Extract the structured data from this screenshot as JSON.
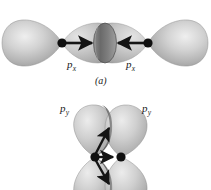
{
  "figure": {
    "background_color": "#ffffff",
    "ink_color": "#141414",
    "orbital_light": "#e2e2e2",
    "orbital_mid": "#b8b8b8",
    "orbital_dark": "#6e6e6e",
    "orbital_shadow": "#4a4a4a",
    "panels": [
      {
        "id": "panel-a",
        "caption": "(a)",
        "description": "Head-on (sigma) overlap of two p-x orbitals",
        "labels": [
          {
            "id": "label-px-left",
            "symbol": "p",
            "subscript": "x"
          },
          {
            "id": "label-px-right",
            "symbol": "p",
            "subscript": "x"
          }
        ],
        "nuclei": [
          {
            "id": "nucleus-left",
            "cx": 62,
            "cy": 43
          },
          {
            "id": "nucleus-right",
            "cx": 148,
            "cy": 43
          }
        ],
        "arrows": [
          {
            "id": "arrow-right",
            "x1": 64,
            "y1": 43,
            "x2": 94,
            "y2": 43,
            "direction": "right"
          },
          {
            "id": "arrow-left",
            "x1": 146,
            "y1": 43,
            "x2": 116,
            "y2": 43,
            "direction": "left"
          }
        ]
      },
      {
        "id": "panel-b",
        "caption": "",
        "description": "Side-by-side (pi) overlap of two p-y orbitals",
        "labels": [
          {
            "id": "label-py-left",
            "symbol": "p",
            "subscript": "y"
          },
          {
            "id": "label-py-right",
            "symbol": "p",
            "subscript": "y"
          }
        ],
        "nuclei": [
          {
            "id": "nucleus-left",
            "cx": 95,
            "cy": 157
          },
          {
            "id": "nucleus-right",
            "cx": 121,
            "cy": 157
          }
        ],
        "arrows": [
          {
            "id": "arrow-up",
            "x1": 95,
            "y1": 155,
            "x2": 110,
            "y2": 126,
            "direction": "up-right"
          },
          {
            "id": "arrow-horizontal",
            "x1": 97,
            "y1": 157,
            "x2": 115,
            "y2": 157,
            "direction": "right"
          },
          {
            "id": "arrow-down",
            "x1": 95,
            "y1": 159,
            "x2": 110,
            "y2": 186,
            "direction": "down-right"
          }
        ]
      }
    ]
  }
}
